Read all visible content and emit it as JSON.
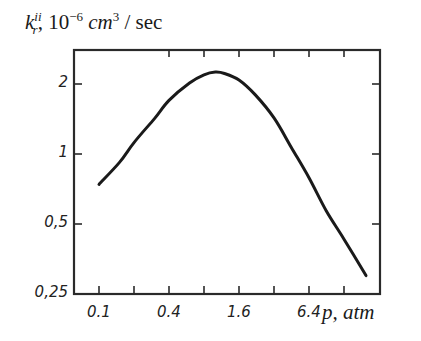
{
  "chart_data": {
    "type": "line",
    "title": "",
    "ylabel": {
      "symbol": "k",
      "superscript": "ii",
      "subscript": "r",
      "rest": ", 10",
      "exp": "−6",
      "units_main": " cm",
      "units_exp": "3",
      "units_tail": " / sec"
    },
    "xlabel": "p, atm",
    "xscale": "log2",
    "yscale": "log2",
    "xlim": [
      0.061,
      30
    ],
    "ylim": [
      0.25,
      2.8
    ],
    "x_ticks": [
      0.1,
      0.2,
      0.4,
      0.8,
      1.6,
      3.2,
      6.4,
      12.8
    ],
    "x_tick_labels": [
      {
        "value": 0.1,
        "label": "0.1"
      },
      {
        "value": 0.4,
        "label": "0.4"
      },
      {
        "value": 1.6,
        "label": "1.6"
      },
      {
        "value": 6.4,
        "label": "6.4"
      }
    ],
    "y_ticks": [
      0.25,
      0.5,
      1,
      2
    ],
    "y_tick_labels": [
      {
        "value": 2,
        "label": "2"
      },
      {
        "value": 1,
        "label": "1"
      },
      {
        "value": 0.5,
        "label": "0,5"
      },
      {
        "value": 0.25,
        "label": "0,25"
      }
    ],
    "grid": false,
    "legend": null,
    "series": [
      {
        "name": "k_r^ii",
        "x": [
          0.1,
          0.15,
          0.2,
          0.3,
          0.4,
          0.6,
          0.8,
          1.0,
          1.2,
          1.6,
          2.2,
          3.2,
          4.5,
          6.4,
          9.0,
          12.8,
          19.8
        ],
        "y": [
          0.74,
          0.92,
          1.12,
          1.42,
          1.7,
          2.02,
          2.19,
          2.25,
          2.22,
          2.08,
          1.8,
          1.43,
          1.07,
          0.79,
          0.57,
          0.43,
          0.3
        ]
      }
    ]
  }
}
